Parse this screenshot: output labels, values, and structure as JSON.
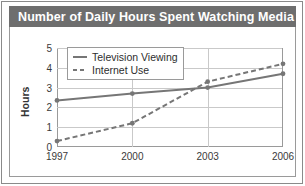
{
  "title": "Number of Daily Hours Spent Watching Media",
  "colors": {
    "title_bar_bg": "#6e6e6e",
    "title_text": "#ffffff",
    "series_television": "#767676",
    "series_internet": "#767676",
    "gridline": "#c9c9c9",
    "axis": "#9a9a9a",
    "panel_bg": "#ffffff"
  },
  "legend": {
    "position": "upper-left-inside",
    "items": [
      {
        "label": "Television Viewing",
        "style": "solid",
        "marker": "dot"
      },
      {
        "label": "Internet Use",
        "style": "dashed",
        "marker": "dot"
      }
    ]
  },
  "chart_data": {
    "type": "line",
    "title": "Number of Daily Hours Spent Watching Media",
    "xlabel": "",
    "ylabel": "Hours",
    "categories": [
      "1997",
      "2000",
      "2003",
      "2006"
    ],
    "x_tick_labels": [
      "1997",
      "2000",
      "2003",
      "2006"
    ],
    "y_tick_labels": [
      "0",
      "1",
      "2",
      "3",
      "4",
      "5"
    ],
    "ylim": [
      0,
      5
    ],
    "ytick_step": 1,
    "grid": "horizontal-and-vertical",
    "series": [
      {
        "name": "Television Viewing",
        "style": "solid",
        "values": [
          2.35,
          2.7,
          3.0,
          3.7
        ]
      },
      {
        "name": "Internet Use",
        "style": "dashed",
        "values": [
          0.3,
          1.2,
          3.3,
          4.2
        ]
      }
    ]
  }
}
